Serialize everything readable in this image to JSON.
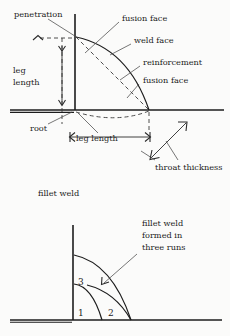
{
  "figure": {
    "background_color": "#fbfbfa",
    "ink_color": "#1d1d1d"
  },
  "top_diagram": {
    "name": "fillet weld cross section",
    "caption": "fillet weld",
    "labels": {
      "penetration": "penetration",
      "fusion_face_top": "fusion face",
      "weld_face": "weld face",
      "reinforcement": "reinforcement",
      "fusion_face_right": "fusion face",
      "leg_length_vertical_line1": "leg",
      "leg_length_vertical_line2": "length",
      "root": "root",
      "leg_length_horizontal": "leg length",
      "throat_thickness": "throat thickness"
    }
  },
  "bottom_diagram": {
    "name": "fillet weld formed in three runs",
    "caption_line1": "fillet weld",
    "caption_line2": "formed in",
    "caption_line3": "three runs",
    "runs": [
      {
        "number": "1"
      },
      {
        "number": "2"
      },
      {
        "number": "3"
      }
    ]
  }
}
